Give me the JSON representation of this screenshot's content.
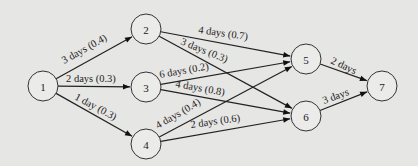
{
  "diagram": {
    "type": "network-activity-graph",
    "background": "#e6e6e4",
    "nodes": [
      {
        "id": "1",
        "label": "1",
        "x": 43,
        "y": 86
      },
      {
        "id": "2",
        "label": "2",
        "x": 146,
        "y": 29
      },
      {
        "id": "3",
        "label": "3",
        "x": 146,
        "y": 87
      },
      {
        "id": "4",
        "label": "4",
        "x": 146,
        "y": 144
      },
      {
        "id": "5",
        "label": "5",
        "x": 306,
        "y": 59
      },
      {
        "id": "6",
        "label": "6",
        "x": 306,
        "y": 116
      },
      {
        "id": "7",
        "label": "7",
        "x": 382,
        "y": 86
      }
    ],
    "edges": [
      {
        "from": "1",
        "to": "2",
        "label": "3 days (0.4)",
        "lx": 64,
        "ly": 64,
        "angle": -29
      },
      {
        "from": "1",
        "to": "3",
        "label": "2 days (0.3)",
        "lx": 66,
        "ly": 82,
        "angle": 0
      },
      {
        "from": "1",
        "to": "4",
        "label": "1 day (0.3)",
        "lx": 74,
        "ly": 99,
        "angle": 28
      },
      {
        "from": "2",
        "to": "5",
        "label": "4 days (0.7)",
        "lx": 198,
        "ly": 33,
        "angle": 8
      },
      {
        "from": "2",
        "to": "6",
        "label": "3 days (0.3)",
        "lx": 180,
        "ly": 44,
        "angle": 22
      },
      {
        "from": "3",
        "to": "5",
        "label": "6 days (0.2)",
        "lx": 160,
        "ly": 78,
        "angle": -10
      },
      {
        "from": "3",
        "to": "6",
        "label": "4 days (0.8)",
        "lx": 175,
        "ly": 87,
        "angle": 10
      },
      {
        "from": "4",
        "to": "5",
        "label": "4 days (0.4)",
        "lx": 158,
        "ly": 129,
        "angle": -30
      },
      {
        "from": "4",
        "to": "6",
        "label": "2 days (0.6)",
        "lx": 191,
        "ly": 128,
        "angle": -8
      },
      {
        "from": "5",
        "to": "7",
        "label": "2 days",
        "lx": 330,
        "ly": 63,
        "angle": 25
      },
      {
        "from": "6",
        "to": "7",
        "label": "3 days",
        "lx": 324,
        "ly": 104,
        "angle": -20
      }
    ]
  }
}
